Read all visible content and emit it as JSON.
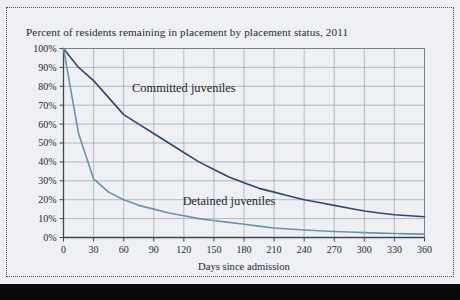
{
  "figure": {
    "title": "Percent of residents remaining in placement by placement status, 2011",
    "background_color": "#eef0f4",
    "frame_style": "dotted"
  },
  "chart_data": {
    "type": "line",
    "title": "Percent of residents remaining in placement by placement status, 2011",
    "xlabel": "Days since admission",
    "ylabel": "",
    "xlim": [
      0,
      360
    ],
    "ylim": [
      0,
      100
    ],
    "grid": true,
    "legend_position": "inline-annotation",
    "x_ticks": [
      0,
      30,
      60,
      90,
      120,
      150,
      180,
      210,
      240,
      270,
      300,
      330,
      360
    ],
    "x_tick_labels": [
      "0",
      "30",
      "60",
      "90",
      "120",
      "150",
      "180",
      "210",
      "240",
      "270",
      "300",
      "330",
      "360"
    ],
    "y_ticks": [
      0,
      10,
      20,
      30,
      40,
      50,
      60,
      70,
      80,
      90,
      100
    ],
    "y_tick_labels": [
      "0%",
      "10%",
      "20%",
      "30%",
      "40%",
      "50%",
      "60%",
      "70%",
      "80%",
      "90%",
      "100%"
    ],
    "x": [
      0,
      15,
      30,
      45,
      60,
      75,
      90,
      105,
      120,
      135,
      150,
      165,
      180,
      195,
      210,
      225,
      240,
      255,
      270,
      285,
      300,
      315,
      330,
      345,
      360
    ],
    "series": [
      {
        "name": "Committed juveniles",
        "color": "#2e4a6b",
        "label_x": 120,
        "label_y": 77,
        "values": [
          100,
          90,
          83,
          74,
          65,
          60,
          55,
          50,
          45,
          40,
          36,
          32,
          29,
          26,
          24,
          22,
          20,
          18.5,
          17,
          15.5,
          14,
          13,
          12,
          11.5,
          11
        ]
      },
      {
        "name": "Detained juveniles",
        "color": "#6d93a8",
        "label_x": 165,
        "label_y": 17,
        "values": [
          100,
          55,
          31,
          24,
          20,
          17,
          15,
          13,
          11.5,
          10,
          9,
          8,
          7,
          6,
          5,
          4.5,
          4,
          3.6,
          3.2,
          2.9,
          2.6,
          2.3,
          2.1,
          1.9,
          1.8
        ]
      }
    ],
    "annotations": [
      {
        "text": "Committed juveniles",
        "x": 120,
        "y": 77
      },
      {
        "text": "Detained juveniles",
        "x": 165,
        "y": 17
      }
    ]
  }
}
